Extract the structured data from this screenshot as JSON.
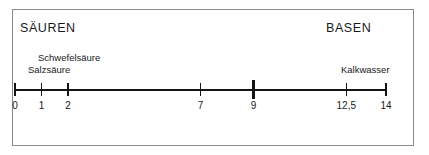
{
  "figure": {
    "title_left": "SÄUREN",
    "title_right": "BASEN"
  },
  "substances": [
    {
      "name": "sulfuric-acid",
      "label": "Schwefelsäure",
      "ph": 2
    },
    {
      "name": "hydrochloric-acid",
      "label": "Salzsäure",
      "ph": 1
    },
    {
      "name": "limewater",
      "label": "Kalkwasser",
      "ph": 12.5
    }
  ],
  "scale": {
    "ticks": [
      {
        "label": "0",
        "value": 0,
        "emphasis": false
      },
      {
        "label": "1",
        "value": 1,
        "emphasis": false
      },
      {
        "label": "2",
        "value": 2,
        "emphasis": false
      },
      {
        "label": "7",
        "value": 7,
        "emphasis": false
      },
      {
        "label": "9",
        "value": 9,
        "emphasis": true
      },
      {
        "label": "12,5",
        "value": 12.5,
        "emphasis": false
      },
      {
        "label": "14",
        "value": 14,
        "emphasis": false
      }
    ]
  },
  "ranges": [
    {
      "name": "acidic",
      "label": "sauer"
    },
    {
      "name": "neutral",
      "label": "neutral"
    },
    {
      "name": "alkaline",
      "label": "alkalisch"
    }
  ],
  "chart_data": {
    "type": "line",
    "xlabel": "pH",
    "ylabel": "",
    "xlim": [
      0,
      14
    ],
    "grid": false,
    "legend": "none",
    "x": [
      0,
      1,
      2,
      7,
      9,
      12.5,
      14
    ],
    "tick_labels": [
      "0",
      "1",
      "2",
      "7",
      "9",
      "12,5",
      "14"
    ],
    "annotations": [
      {
        "text": "SÄUREN",
        "x": 0,
        "position": "top-left"
      },
      {
        "text": "BASEN",
        "x": 14,
        "position": "top-right"
      },
      {
        "text": "Schwefelsäure",
        "x": 2
      },
      {
        "text": "Salzsäure",
        "x": 1
      },
      {
        "text": "Kalkwasser",
        "x": 12.5
      },
      {
        "text": "sauer",
        "x_range": [
          0,
          7
        ]
      },
      {
        "text": "neutral",
        "x_range": [
          7,
          9
        ]
      },
      {
        "text": "alkalisch",
        "x_range": [
          9,
          14
        ]
      }
    ]
  }
}
